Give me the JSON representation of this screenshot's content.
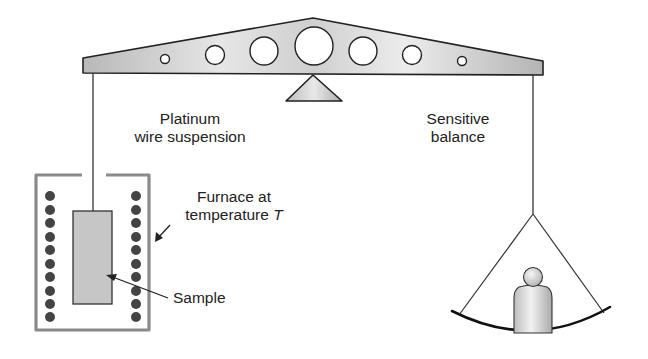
{
  "diagram": {
    "type": "thermogravimetric-analysis-apparatus",
    "labels": {
      "platinum_line1": "Platinum",
      "platinum_line2": "wire suspension",
      "balance_line1": "Sensitive",
      "balance_line2": "balance",
      "furnace_line1": "Furnace at",
      "furnace_line2": "temperature ",
      "furnace_var": "T",
      "sample": "Sample"
    },
    "components": [
      {
        "name": "balance-beam",
        "description": "tapered beam with 7 circular holes"
      },
      {
        "name": "fulcrum",
        "description": "triangular pivot"
      },
      {
        "name": "platinum-wire",
        "description": "suspension wire from left end of beam"
      },
      {
        "name": "furnace",
        "description": "enclosure with two columns of 10 heating elements"
      },
      {
        "name": "sample",
        "description": "rectangular sample hanging in furnace"
      },
      {
        "name": "pan",
        "description": "balance pan on right side with counterweight"
      },
      {
        "name": "counterweight",
        "description": "bell-shaped weight on pan"
      }
    ],
    "colors": {
      "stroke": "#222222",
      "beam_fill": "#c8c8c8",
      "furnace_wall": "#8a8a8a",
      "heating_element": "#444444",
      "sample_fill": "#c4c4c4"
    }
  }
}
